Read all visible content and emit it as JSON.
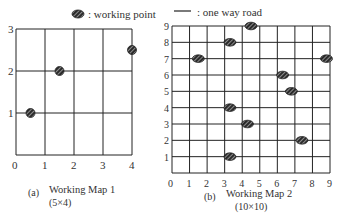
{
  "legend": {
    "working_point_label": ": working point",
    "one_way_road_label": ": one way road"
  },
  "map1": {
    "caption_tag": "(a)",
    "caption_title": "Working Map 1",
    "caption_size": "(5×4)",
    "x_ticks": [
      "0",
      "1",
      "2",
      "3",
      "4"
    ],
    "y_ticks": [
      "1",
      "2",
      "3"
    ],
    "points": [
      [
        0.5,
        1
      ],
      [
        1.5,
        2
      ],
      [
        4,
        2.5
      ]
    ]
  },
  "map2": {
    "caption_tag": "(b)",
    "caption_title": "Working Map 2",
    "caption_size": "(10×10)",
    "x_ticks": [
      "0",
      "1",
      "2",
      "3",
      "4",
      "5",
      "6",
      "7",
      "8",
      "9"
    ],
    "y_ticks": [
      "1",
      "2",
      "3",
      "4",
      "5",
      "6",
      "7",
      "8",
      "9"
    ],
    "points": [
      [
        1.5,
        7
      ],
      [
        3.3,
        8
      ],
      [
        4.5,
        9
      ],
      [
        6.3,
        6
      ],
      [
        6.8,
        5
      ],
      [
        8.8,
        7
      ],
      [
        3.3,
        4
      ],
      [
        4.3,
        3
      ],
      [
        7.4,
        2
      ],
      [
        3.3,
        1
      ]
    ]
  },
  "colors": {
    "line": "#222222",
    "marker": "#333333"
  }
}
